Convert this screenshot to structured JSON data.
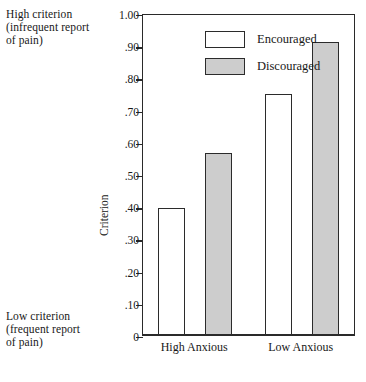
{
  "chart_data": {
    "type": "bar",
    "title": "",
    "xlabel": "",
    "ylabel": "Criterion",
    "categories": [
      "High Anxious",
      "Low Anxious"
    ],
    "series": [
      {
        "name": "Encouraged",
        "values": [
          0.395,
          0.75
        ],
        "fill": "#ffffff"
      },
      {
        "name": "Discouraged",
        "values": [
          0.565,
          0.91
        ],
        "fill": "#cdcdcd"
      }
    ],
    "ylim": [
      0,
      1.0
    ],
    "ytick_values": [
      1.0,
      0.9,
      0.8,
      0.7,
      0.6,
      0.5,
      0.4,
      0.3,
      0.2,
      0.1,
      0
    ],
    "ytick_labels": [
      "1.00",
      ".90",
      ".80",
      ".70",
      ".60",
      ".50",
      ".40",
      ".30",
      ".20",
      ".10",
      "0"
    ],
    "grid": false,
    "legend_position": "top-left-inside"
  },
  "annotations": {
    "high": {
      "line1": "High criterion",
      "line2": "(infrequent report",
      "line3": "of pain)"
    },
    "low": {
      "line1": "Low criterion",
      "line2": "(frequent report",
      "line3": "of pain)"
    }
  },
  "colors": {
    "axis": "#2a2a2a",
    "bar_border": "#2b2b2b",
    "encouraged_fill": "#ffffff",
    "discouraged_fill": "#cdcdcd",
    "text": "#181818",
    "background": "#ffffff"
  }
}
